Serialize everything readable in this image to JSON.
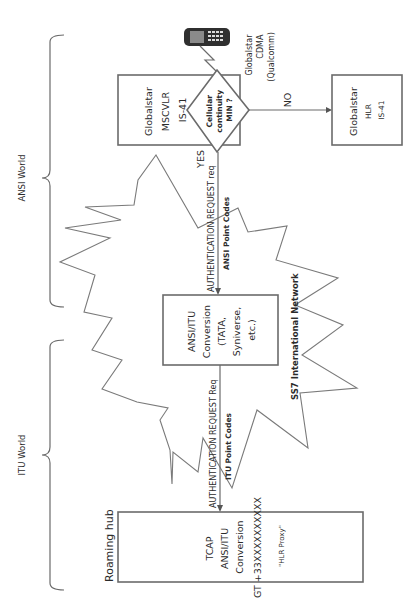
{
  "diagram": {
    "regions": {
      "ansi_world": "ANSI World",
      "itu_world": "ITU World"
    },
    "network_cloud": {
      "label": "SS7 International Network"
    },
    "phone": {
      "icon": "mobile-phone-icon",
      "label_lines": [
        "Globalstar",
        "CDMA",
        "(Qualcomm)"
      ]
    },
    "msc_vlr": {
      "label_lines": [
        "Globalstar",
        "MSCVLR",
        "IS-41"
      ]
    },
    "decision": {
      "label_lines": [
        "Cellular",
        "continuity",
        "MIN ?"
      ],
      "yes_label": "YES",
      "no_label": "NO"
    },
    "hlr": {
      "label_lines": [
        "Globalstar",
        "HLR",
        "IS-41"
      ]
    },
    "ansi_link": {
      "message": "AUTHENTICATION REQUEST req",
      "codes": "ANSI Point Codes"
    },
    "conversion": {
      "label_lines": [
        "ANSI/ITU",
        "Conversion",
        "(TATA,",
        "Syniverse,",
        "etc.)"
      ]
    },
    "itu_link": {
      "message": "AUTHENTICATION REQUEST Req",
      "codes": "ITU Point Codes"
    },
    "roaming_hub": {
      "title": "Roaming hub",
      "label_lines": [
        "TCAP",
        "ANSI/ITU",
        "Conversion",
        "GT +33XXXXXXXXXX"
      ],
      "proxy_label": "\"HLR Proxy\""
    },
    "colors": {
      "stroke": "#6b6b6b",
      "text": "#2b2b2b",
      "background": "#ffffff"
    }
  }
}
